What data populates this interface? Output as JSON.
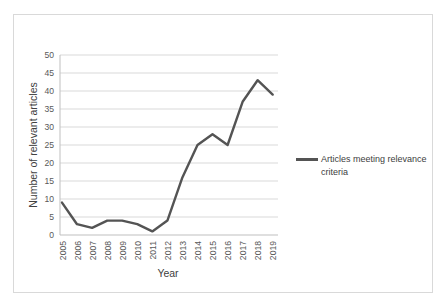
{
  "figure": {
    "legend": {
      "label_line1": "Articles meeting relevance",
      "label_line2": "criteria"
    }
  },
  "chart_data": {
    "type": "line",
    "categories": [
      "2005",
      "2006",
      "2007",
      "2008",
      "2009",
      "2010",
      "2011",
      "2012",
      "2013",
      "2014",
      "2015",
      "2016",
      "2017",
      "2018",
      "2019"
    ],
    "series": [
      {
        "name": "Articles meeting relevance criteria",
        "values": [
          9,
          3,
          2,
          4,
          4,
          3,
          1,
          4,
          16,
          25,
          28,
          25,
          37,
          43,
          39
        ]
      }
    ],
    "title": "",
    "xlabel": "Year",
    "ylabel": "Number of relevant articles",
    "ylim": [
      0,
      50
    ],
    "ytick_step": 5,
    "grid": true,
    "legend_position": "right",
    "colors": {
      "line": "#545454",
      "grid": "#d9d9d9",
      "axis": "#bfbfbf",
      "tick_text": "#595959",
      "title_text": "#404040",
      "border": "#d9d9d9"
    }
  }
}
